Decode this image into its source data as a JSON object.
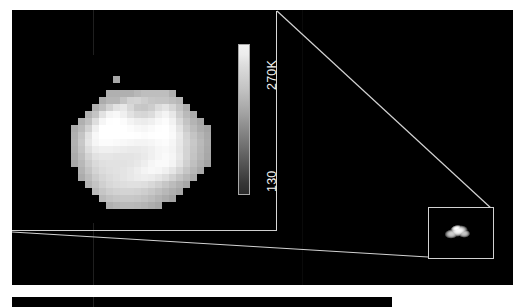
{
  "figure": {
    "kind": "thermal-map-figure",
    "background_color": "#ffffff",
    "panel_color": "#000000",
    "line_color": "#d2d2d2"
  },
  "colorbar": {
    "max_label": "270K",
    "min_label": "130",
    "units": "K",
    "orientation": "vertical",
    "gradient_top_color": "#f2f2f2",
    "gradient_bottom_color": "#2b2b2b"
  },
  "panels": {
    "main_label": "magnified-thermal-map",
    "inset_label": "context-image",
    "bottom_label": "second-panel"
  },
  "chart_data": {
    "type": "heatmap",
    "title": "",
    "xlabel": "",
    "ylabel": "",
    "colorbar_label": "Temperature (K)",
    "vmin": 130,
    "vmax": 270,
    "cmap": "gray",
    "nx": 26,
    "ny": 24,
    "values": [
      [
        0,
        0,
        0,
        0,
        0,
        0,
        0,
        0,
        0,
        0,
        0,
        0,
        0,
        0,
        0,
        0,
        0,
        0,
        0,
        0,
        0,
        0,
        0,
        0,
        0,
        0
      ],
      [
        0,
        0,
        0,
        0,
        0,
        0,
        0,
        0,
        0,
        0,
        0,
        0,
        0,
        0,
        0,
        0,
        0,
        0,
        0,
        0,
        0,
        0,
        0,
        0,
        0,
        0
      ],
      [
        0,
        0,
        0,
        0,
        0,
        0,
        0,
        0,
        0,
        0,
        0,
        0,
        0,
        0,
        0,
        0,
        0,
        0,
        0,
        0,
        0,
        0,
        0,
        0,
        0,
        0
      ],
      [
        0,
        0,
        0,
        0,
        0,
        0,
        0,
        0,
        0,
        168,
        0,
        0,
        0,
        0,
        0,
        0,
        0,
        0,
        0,
        0,
        0,
        0,
        0,
        0,
        0,
        0
      ],
      [
        0,
        0,
        0,
        0,
        0,
        0,
        0,
        0,
        0,
        0,
        0,
        0,
        0,
        0,
        0,
        0,
        0,
        0,
        0,
        0,
        0,
        0,
        0,
        0,
        0,
        0
      ],
      [
        0,
        0,
        0,
        0,
        0,
        0,
        0,
        0,
        176,
        176,
        176,
        176,
        184,
        190,
        190,
        190,
        190,
        176,
        0,
        0,
        0,
        0,
        0,
        0,
        0,
        0
      ],
      [
        0,
        0,
        0,
        0,
        0,
        0,
        0,
        172,
        182,
        182,
        196,
        210,
        212,
        205,
        198,
        196,
        196,
        190,
        184,
        0,
        0,
        0,
        0,
        0,
        0,
        0
      ],
      [
        0,
        0,
        0,
        0,
        0,
        0,
        176,
        190,
        210,
        226,
        232,
        216,
        200,
        198,
        205,
        220,
        228,
        214,
        196,
        176,
        0,
        0,
        0,
        0,
        0,
        0
      ],
      [
        0,
        0,
        0,
        0,
        0,
        178,
        196,
        226,
        244,
        248,
        240,
        226,
        216,
        214,
        220,
        236,
        244,
        232,
        206,
        186,
        172,
        0,
        0,
        0,
        0,
        0
      ],
      [
        0,
        0,
        0,
        0,
        176,
        192,
        222,
        246,
        254,
        256,
        252,
        244,
        238,
        236,
        240,
        248,
        252,
        242,
        218,
        196,
        180,
        168,
        0,
        0,
        0,
        0
      ],
      [
        0,
        0,
        0,
        172,
        186,
        210,
        240,
        255,
        258,
        258,
        256,
        252,
        248,
        246,
        250,
        254,
        256,
        248,
        228,
        204,
        188,
        174,
        166,
        0,
        0,
        0
      ],
      [
        0,
        0,
        0,
        176,
        196,
        226,
        248,
        258,
        260,
        260,
        258,
        256,
        254,
        252,
        254,
        256,
        256,
        250,
        234,
        212,
        196,
        182,
        170,
        0,
        0,
        0
      ],
      [
        0,
        0,
        0,
        178,
        200,
        230,
        246,
        252,
        252,
        250,
        248,
        246,
        244,
        244,
        246,
        250,
        252,
        246,
        232,
        214,
        200,
        186,
        172,
        0,
        0,
        0
      ],
      [
        0,
        0,
        0,
        176,
        196,
        222,
        236,
        240,
        240,
        238,
        236,
        234,
        234,
        236,
        240,
        246,
        248,
        244,
        230,
        212,
        198,
        184,
        170,
        0,
        0,
        0
      ],
      [
        0,
        0,
        0,
        172,
        190,
        212,
        226,
        230,
        230,
        228,
        228,
        228,
        230,
        234,
        240,
        246,
        250,
        246,
        232,
        212,
        196,
        182,
        168,
        0,
        0,
        0
      ],
      [
        0,
        0,
        0,
        168,
        184,
        204,
        218,
        224,
        226,
        226,
        226,
        228,
        232,
        238,
        246,
        250,
        250,
        244,
        228,
        208,
        192,
        178,
        164,
        0,
        0,
        0
      ],
      [
        0,
        0,
        0,
        0,
        178,
        196,
        212,
        220,
        224,
        226,
        228,
        232,
        238,
        244,
        248,
        246,
        240,
        230,
        214,
        198,
        184,
        170,
        0,
        0,
        0,
        0
      ],
      [
        0,
        0,
        0,
        0,
        172,
        188,
        204,
        214,
        220,
        224,
        228,
        232,
        236,
        238,
        236,
        230,
        222,
        210,
        196,
        184,
        172,
        0,
        0,
        0,
        0,
        0
      ],
      [
        0,
        0,
        0,
        0,
        0,
        180,
        196,
        208,
        216,
        220,
        222,
        224,
        224,
        222,
        216,
        208,
        198,
        188,
        178,
        168,
        0,
        0,
        0,
        0,
        0,
        0
      ],
      [
        0,
        0,
        0,
        0,
        0,
        0,
        186,
        198,
        206,
        210,
        212,
        212,
        210,
        206,
        200,
        192,
        184,
        176,
        168,
        0,
        0,
        0,
        0,
        0,
        0,
        0
      ],
      [
        0,
        0,
        0,
        0,
        0,
        0,
        0,
        186,
        194,
        198,
        200,
        200,
        198,
        194,
        188,
        180,
        172,
        164,
        0,
        0,
        0,
        0,
        0,
        0,
        0,
        0
      ],
      [
        0,
        0,
        0,
        0,
        0,
        0,
        0,
        0,
        176,
        182,
        186,
        186,
        184,
        180,
        174,
        168,
        0,
        0,
        0,
        0,
        0,
        0,
        0,
        0,
        0,
        0
      ],
      [
        0,
        0,
        0,
        0,
        0,
        0,
        0,
        0,
        0,
        0,
        0,
        0,
        0,
        0,
        0,
        0,
        0,
        0,
        0,
        0,
        0,
        0,
        0,
        0,
        0,
        0
      ],
      [
        0,
        0,
        0,
        0,
        0,
        0,
        0,
        0,
        0,
        0,
        0,
        0,
        0,
        0,
        0,
        0,
        0,
        0,
        0,
        0,
        0,
        0,
        0,
        0,
        0,
        0
      ]
    ],
    "legend": "colorbar",
    "grid": false
  }
}
